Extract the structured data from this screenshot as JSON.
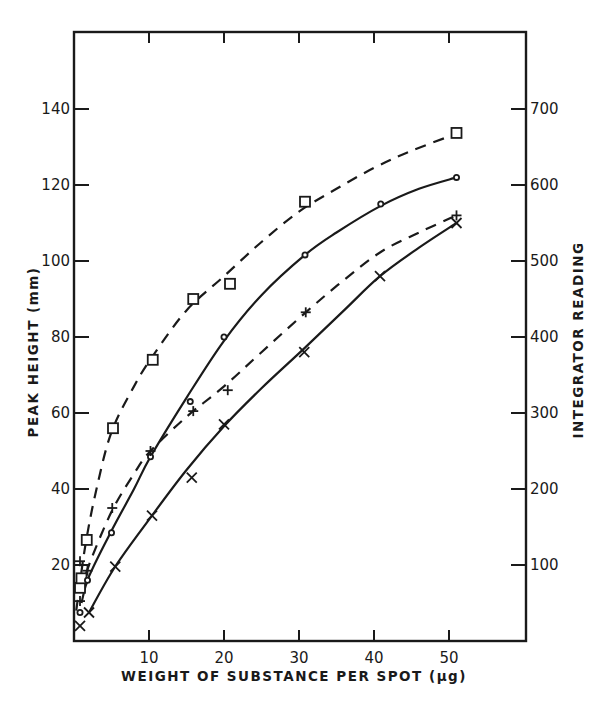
{
  "chart_data": {
    "type": "scatter",
    "title": "",
    "xlabel": "WEIGHT OF SUBSTANCE PER SPOT (µg)",
    "ylabel": "PEAK HEIGHT (mm)",
    "y2label": "INTEGRATOR READING",
    "xlim": [
      0,
      60
    ],
    "ylim": [
      0,
      160
    ],
    "y2lim": [
      0,
      800
    ],
    "x_ticks": [
      10,
      20,
      30,
      40,
      50
    ],
    "x_tick_labels": [
      "10",
      "20",
      "30",
      "40",
      "50"
    ],
    "y_ticks": [
      20,
      40,
      60,
      80,
      100,
      120,
      140
    ],
    "y_tick_labels": [
      "20",
      "40",
      "60",
      "80",
      "100",
      "120",
      "140"
    ],
    "y2_ticks": [
      100,
      200,
      300,
      400,
      500,
      600,
      700
    ],
    "y2_tick_labels": [
      "100",
      "200",
      "300",
      "400",
      "500",
      "600",
      "700"
    ],
    "grid": false,
    "legend": null,
    "series": [
      {
        "name": "squares (dashed)",
        "marker": "square",
        "line": "dashed",
        "points": [
          [
            0.8,
            14
          ],
          [
            1,
            16.5
          ],
          [
            1.7,
            26.6
          ],
          [
            5.2,
            56
          ],
          [
            10.5,
            74
          ],
          [
            15.9,
            90
          ],
          [
            20.8,
            94
          ],
          [
            30.8,
            115.6
          ],
          [
            51,
            133.7
          ]
        ],
        "curve": [
          [
            0.3,
            8
          ],
          [
            1.5,
            25
          ],
          [
            3,
            40
          ],
          [
            5,
            55
          ],
          [
            8,
            67
          ],
          [
            10.5,
            75
          ],
          [
            15,
            87
          ],
          [
            20,
            96
          ],
          [
            25,
            105
          ],
          [
            30,
            113
          ],
          [
            35,
            119
          ],
          [
            40,
            124.5
          ],
          [
            45,
            129
          ],
          [
            51,
            133.5
          ]
        ]
      },
      {
        "name": "circles (solid)",
        "marker": "circle",
        "line": "solid",
        "points": [
          [
            0.8,
            7.5
          ],
          [
            1.8,
            16
          ],
          [
            5,
            28.5
          ],
          [
            10.2,
            48.5
          ],
          [
            15.5,
            63
          ],
          [
            20,
            80
          ],
          [
            30.8,
            101.6
          ],
          [
            40.9,
            115
          ],
          [
            51,
            122
          ]
        ],
        "curve": [
          [
            1,
            10
          ],
          [
            2,
            17
          ],
          [
            5,
            29
          ],
          [
            8,
            40
          ],
          [
            10.2,
            48.5
          ],
          [
            15,
            64
          ],
          [
            20,
            79
          ],
          [
            25,
            91
          ],
          [
            30.8,
            101.6
          ],
          [
            35,
            107.5
          ],
          [
            40.9,
            114.5
          ],
          [
            46,
            119
          ],
          [
            51,
            122
          ]
        ]
      },
      {
        "name": "plus (dashed)",
        "marker": "plus",
        "line": "dashed",
        "points": [
          [
            0.8,
            10.5
          ],
          [
            0.8,
            21
          ],
          [
            1.8,
            18.5
          ],
          [
            5.1,
            35
          ],
          [
            10.2,
            50
          ],
          [
            15.9,
            60.5
          ],
          [
            20.5,
            66
          ],
          [
            30.9,
            86.5
          ],
          [
            51,
            112
          ]
        ],
        "curve": [
          [
            1,
            13
          ],
          [
            2,
            20
          ],
          [
            5,
            34
          ],
          [
            8,
            44
          ],
          [
            10.2,
            50
          ],
          [
            15,
            59
          ],
          [
            20,
            67
          ],
          [
            25,
            76
          ],
          [
            30.9,
            86.5
          ],
          [
            36,
            95
          ],
          [
            41,
            102.5
          ],
          [
            46,
            107.5
          ],
          [
            51,
            112
          ]
        ]
      },
      {
        "name": "crosses (solid)",
        "marker": "x",
        "line": "solid",
        "points": [
          [
            0.8,
            4
          ],
          [
            2,
            7.5
          ],
          [
            5.5,
            19.6
          ],
          [
            10.4,
            33
          ],
          [
            15.7,
            43
          ],
          [
            20,
            57
          ],
          [
            30.7,
            76
          ],
          [
            40.8,
            96
          ],
          [
            51,
            110
          ]
        ],
        "curve": [
          [
            2,
            7.5
          ],
          [
            5.5,
            19.6
          ],
          [
            10.4,
            33
          ],
          [
            15,
            45
          ],
          [
            20,
            56.5
          ],
          [
            25,
            66.5
          ],
          [
            30.7,
            77
          ],
          [
            36,
            87
          ],
          [
            40.8,
            96
          ],
          [
            46,
            103.5
          ],
          [
            51,
            110
          ]
        ]
      }
    ]
  },
  "axes": {
    "xlabel": "WEIGHT OF SUBSTANCE PER SPOT (µg)",
    "ylabel": "PEAK HEIGHT (mm)",
    "y2label": "INTEGRATOR READING"
  }
}
